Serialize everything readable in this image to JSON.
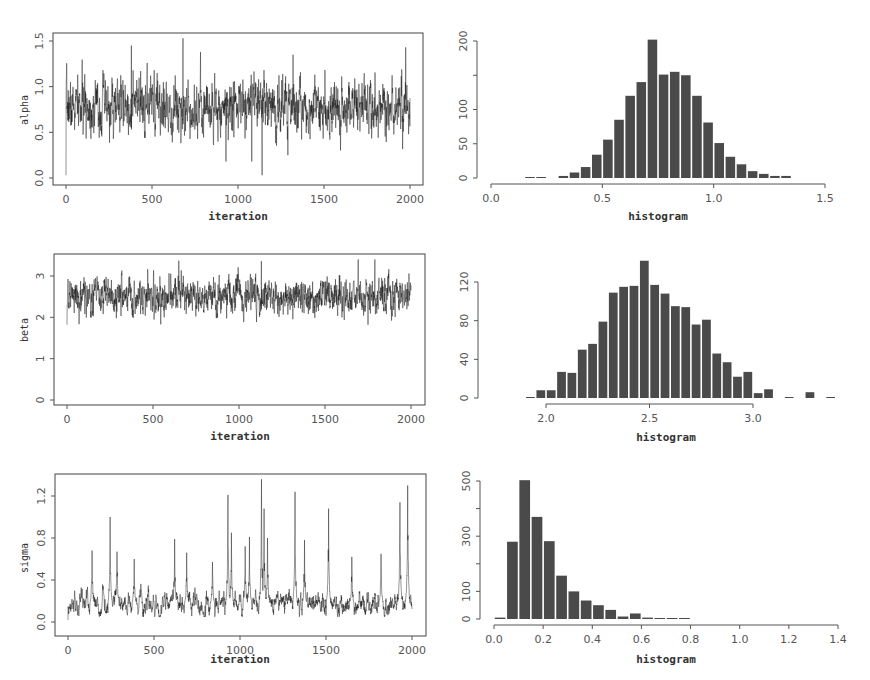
{
  "chart_data": [
    {
      "type": "line",
      "id": "alpha-trace",
      "title": "",
      "xlabel": "iteration",
      "ylabel": "alpha",
      "xticks": [
        "0",
        "500",
        "1000",
        "1500",
        "2000"
      ],
      "yticks": [
        "0.0",
        "0.5",
        "1.0",
        "1.5"
      ],
      "xlim": [
        0,
        2000
      ],
      "ylim": [
        0.0,
        1.5
      ],
      "n_iterations": 2000,
      "start_value": 0.0,
      "mean": 0.78,
      "sd": 0.15,
      "max_value": 1.53,
      "min_value": 0.03,
      "notable_points": [
        {
          "x": 380,
          "y": 1.45
        },
        {
          "x": 680,
          "y": 1.53
        },
        {
          "x": 930,
          "y": 0.18
        },
        {
          "x": 1140,
          "y": 0.03
        },
        {
          "x": 1080,
          "y": 0.18
        },
        {
          "x": 1290,
          "y": 0.25
        },
        {
          "x": 1320,
          "y": 1.35
        },
        {
          "x": 1975,
          "y": 1.43
        }
      ],
      "grid": false
    },
    {
      "type": "bar",
      "id": "alpha-hist",
      "xlabel": "histogram",
      "ylabel": "",
      "xticks": [
        "0.0",
        "0.5",
        "1.0",
        "1.5"
      ],
      "yticks": [
        "0",
        "50",
        "100",
        "150",
        "200"
      ],
      "ytick_labels_shown": [
        "0",
        "50",
        "100",
        "200"
      ],
      "xlim": [
        0.0,
        1.5
      ],
      "ylim": [
        0,
        200
      ],
      "bin_width": 0.05,
      "bin_starts": [
        0.15,
        0.2,
        0.3,
        0.35,
        0.4,
        0.45,
        0.5,
        0.55,
        0.6,
        0.65,
        0.7,
        0.75,
        0.8,
        0.85,
        0.9,
        0.95,
        1.0,
        1.05,
        1.1,
        1.15,
        1.2,
        1.25,
        1.3
      ],
      "values": [
        1,
        1,
        3,
        8,
        16,
        34,
        56,
        85,
        120,
        140,
        202,
        151,
        155,
        150,
        120,
        81,
        51,
        31,
        20,
        10,
        6,
        3,
        3
      ],
      "grid": false
    },
    {
      "type": "line",
      "id": "beta-trace",
      "xlabel": "iteration",
      "ylabel": "beta",
      "xticks": [
        "0",
        "500",
        "1000",
        "1500",
        "2000"
      ],
      "yticks": [
        "0",
        "1",
        "2",
        "3"
      ],
      "xlim": [
        0,
        2000
      ],
      "ylim": [
        0,
        3.4
      ],
      "n_iterations": 2000,
      "start_value": 0.0,
      "mean": 2.52,
      "sd": 0.22,
      "max_value": 3.4,
      "min_value": 1.82,
      "notable_points": [
        {
          "x": 650,
          "y": 3.37
        },
        {
          "x": 1130,
          "y": 3.36
        },
        {
          "x": 1790,
          "y": 3.4
        },
        {
          "x": 545,
          "y": 1.83
        },
        {
          "x": 1750,
          "y": 1.82
        }
      ],
      "grid": false
    },
    {
      "type": "bar",
      "id": "beta-hist",
      "xlabel": "histogram",
      "ylabel": "",
      "xticks": [
        "2.0",
        "2.5",
        "3.0"
      ],
      "yticks": [
        "0",
        "40",
        "80",
        "120"
      ],
      "xlim": [
        1.9,
        3.4
      ],
      "ylim": [
        0,
        140
      ],
      "bin_width": 0.05,
      "bin_starts": [
        1.9,
        1.95,
        2.0,
        2.05,
        2.1,
        2.15,
        2.2,
        2.25,
        2.3,
        2.35,
        2.4,
        2.45,
        2.5,
        2.55,
        2.6,
        2.65,
        2.7,
        2.75,
        2.8,
        2.85,
        2.9,
        2.95,
        3.0,
        3.05,
        3.15,
        3.25,
        3.35
      ],
      "values": [
        1,
        8,
        8,
        27,
        26,
        50,
        56,
        79,
        109,
        115,
        116,
        142,
        117,
        108,
        95,
        94,
        76,
        81,
        46,
        37,
        22,
        27,
        5,
        9,
        1,
        6,
        1
      ],
      "grid": false
    },
    {
      "type": "line",
      "id": "sigma-trace",
      "xlabel": "iteration",
      "ylabel": "sigma",
      "xticks": [
        "0",
        "500",
        "1000",
        "1500",
        "2000"
      ],
      "yticks": [
        "0.0",
        "0.4",
        "0.8",
        "1.2"
      ],
      "xlim": [
        0,
        2000
      ],
      "ylim": [
        0.0,
        1.35
      ],
      "n_iterations": 2000,
      "start_value": 0.02,
      "baseline": 0.17,
      "max_value": 1.36,
      "notable_points": [
        {
          "x": 140,
          "y": 0.68
        },
        {
          "x": 245,
          "y": 1.0
        },
        {
          "x": 285,
          "y": 0.67
        },
        {
          "x": 385,
          "y": 0.6
        },
        {
          "x": 620,
          "y": 0.79
        },
        {
          "x": 690,
          "y": 0.66
        },
        {
          "x": 840,
          "y": 0.57
        },
        {
          "x": 930,
          "y": 1.21
        },
        {
          "x": 950,
          "y": 0.85
        },
        {
          "x": 1030,
          "y": 0.72
        },
        {
          "x": 1055,
          "y": 0.81
        },
        {
          "x": 1125,
          "y": 1.36
        },
        {
          "x": 1140,
          "y": 1.08
        },
        {
          "x": 1160,
          "y": 0.8
        },
        {
          "x": 1320,
          "y": 1.24
        },
        {
          "x": 1375,
          "y": 0.78
        },
        {
          "x": 1515,
          "y": 1.08
        },
        {
          "x": 1650,
          "y": 0.62
        },
        {
          "x": 1820,
          "y": 0.65
        },
        {
          "x": 1930,
          "y": 1.14
        },
        {
          "x": 1975,
          "y": 1.3
        }
      ],
      "grid": false
    },
    {
      "type": "bar",
      "id": "sigma-hist",
      "xlabel": "histogram",
      "ylabel": "",
      "xticks": [
        "0.0",
        "0.2",
        "0.4",
        "0.6",
        "0.8",
        "1.0",
        "1.2",
        "1.4"
      ],
      "yticks": [
        "0",
        "100",
        "200",
        "300",
        "400",
        "500"
      ],
      "ytick_labels_shown": [
        "0",
        "100",
        "300",
        "500"
      ],
      "xlim": [
        0.0,
        1.4
      ],
      "ylim": [
        0,
        500
      ],
      "bin_width": 0.05,
      "bin_starts": [
        0.0,
        0.05,
        0.1,
        0.15,
        0.2,
        0.25,
        0.3,
        0.35,
        0.4,
        0.45,
        0.5,
        0.55,
        0.6,
        0.65,
        0.7,
        0.75
      ],
      "values": [
        5,
        280,
        503,
        370,
        282,
        157,
        100,
        67,
        50,
        33,
        9,
        20,
        5,
        1,
        2,
        1
      ],
      "grid": false
    }
  ],
  "panels": {
    "alpha_trace": {
      "ylabel": "alpha",
      "xlabel": "iteration"
    },
    "alpha_hist": {
      "xlabel": "histogram"
    },
    "beta_trace": {
      "ylabel": "beta",
      "xlabel": "iteration"
    },
    "beta_hist": {
      "xlabel": "histogram"
    },
    "sigma_trace": {
      "ylabel": "sigma",
      "xlabel": "iteration"
    },
    "sigma_hist": {
      "xlabel": "histogram"
    }
  },
  "colors": {
    "line": "#1a1a1a",
    "bar": "#4a4a4a",
    "axis": "#555555",
    "bar_edge": "#ffffff"
  }
}
